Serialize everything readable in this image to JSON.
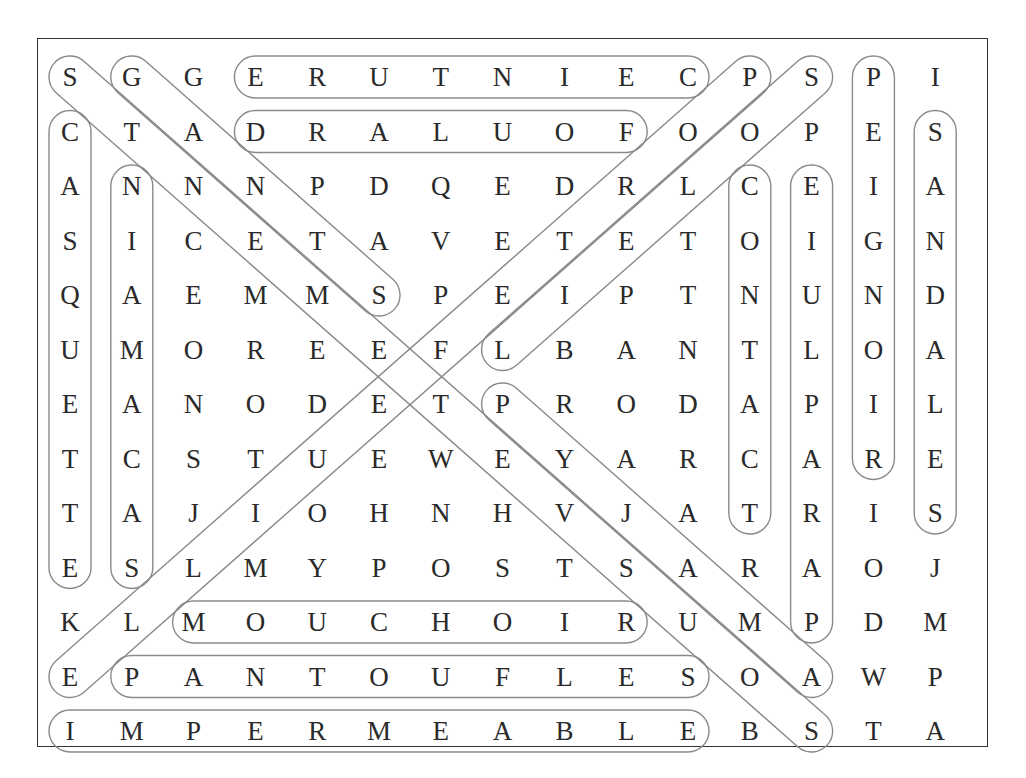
{
  "puzzle": {
    "type": "word-search",
    "rows": [
      "SGGERUTNIECPSPI",
      "CTADRALUOFOOPES",
      "ANNNPDQEDRLCEIA",
      "SICETAVETETOIGN",
      "QAEMMSPEIPTNUND",
      "UMOREEFLBANTLOA",
      "EANODETPRODAPIL",
      "TCSTUEWEYARCARE",
      "TAJIOHNHVJATRIS",
      "ESLMYPOSTSARAOJ",
      "KLMOUCHOIRUMPDM",
      "EPANTOUFLESOAWP",
      "IMPERMEABLEBSTA"
    ],
    "found_words": [
      {
        "word": "CEINTURE",
        "start": [
          0,
          10
        ],
        "end": [
          0,
          3
        ]
      },
      {
        "word": "FOULARD",
        "start": [
          1,
          9
        ],
        "end": [
          1,
          3
        ]
      },
      {
        "word": "MOUCHOIR",
        "start": [
          10,
          2
        ],
        "end": [
          10,
          9
        ]
      },
      {
        "word": "PANTOUFLES",
        "start": [
          11,
          1
        ],
        "end": [
          11,
          10
        ]
      },
      {
        "word": "IMPERMEABLE",
        "start": [
          12,
          0
        ],
        "end": [
          12,
          10
        ]
      },
      {
        "word": "CASQUETTE",
        "start": [
          1,
          0
        ],
        "end": [
          9,
          0
        ]
      },
      {
        "word": "SACAMAIN",
        "start": [
          9,
          1
        ],
        "end": [
          2,
          1
        ]
      },
      {
        "word": "CONTACT",
        "start": [
          2,
          11
        ],
        "end": [
          8,
          11
        ]
      },
      {
        "word": "PARAPLUIE",
        "start": [
          10,
          12
        ],
        "end": [
          2,
          12
        ]
      },
      {
        "word": "PEIGNOIR",
        "start": [
          0,
          13
        ],
        "end": [
          7,
          13
        ]
      },
      {
        "word": "SANDALES",
        "start": [
          1,
          14
        ],
        "end": [
          8,
          14
        ]
      },
      {
        "word": "SOUTIEN-GORGE",
        "start": [
          0,
          0
        ],
        "end": [
          12,
          12
        ]
      },
      {
        "word": "GANTS",
        "start": [
          0,
          1
        ],
        "end": [
          4,
          5
        ]
      },
      {
        "word": "PYJAMA",
        "start": [
          6,
          7
        ],
        "end": [
          11,
          12
        ]
      },
      {
        "word": "PULLOVER",
        "start": [
          0,
          11
        ],
        "end": [
          11,
          0
        ]
      },
      {
        "word": "SPOLLEPEL",
        "start": [
          0,
          12
        ],
        "end": [
          5,
          7
        ]
      }
    ]
  }
}
